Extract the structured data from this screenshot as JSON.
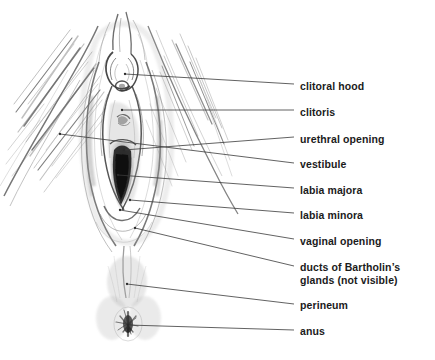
{
  "figure": {
    "background_color": "#ffffff",
    "ink_color": "#1b1b1b",
    "leader_line_color": "#3a3a3a",
    "illustration_style": "graphite pencil sketch with hatching"
  },
  "labels": [
    {
      "id": "clitoral-hood",
      "text": "clitoral hood",
      "text_x": 300,
      "text_y": 87,
      "leader": {
        "x1": 125,
        "y1": 74,
        "x2": 294,
        "y2": 84
      }
    },
    {
      "id": "clitoris",
      "text": "clitoris",
      "text_x": 300,
      "text_y": 113,
      "leader": {
        "x1": 122,
        "y1": 110,
        "x2": 294,
        "y2": 110
      }
    },
    {
      "id": "urethral-opening",
      "text": "urethral opening",
      "text_x": 300,
      "text_y": 140,
      "leader": {
        "x1": 124,
        "y1": 150,
        "x2": 294,
        "y2": 137
      }
    },
    {
      "id": "vestibule",
      "text": "vestibule",
      "text_x": 300,
      "text_y": 165,
      "leader": {
        "x1": 60,
        "y1": 134,
        "x2": 294,
        "y2": 163
      }
    },
    {
      "id": "labia-majora",
      "text": "labia majora",
      "text_x": 300,
      "text_y": 191,
      "leader": {
        "x1": 118,
        "y1": 175,
        "x2": 294,
        "y2": 188
      }
    },
    {
      "id": "labia-minora",
      "text": "labia minora",
      "text_x": 300,
      "text_y": 216,
      "leader": {
        "x1": 130,
        "y1": 200,
        "x2": 294,
        "y2": 213
      }
    },
    {
      "id": "vaginal-opening",
      "text": "vaginal opening",
      "text_x": 300,
      "text_y": 242,
      "leader": {
        "x1": 120,
        "y1": 210,
        "x2": 294,
        "y2": 239
      }
    },
    {
      "id": "ducts-of-bartholins-glands",
      "text": "ducts of Bartholin’s glands (not visible)",
      "text_x": 300,
      "text_y": 268,
      "two_line": true,
      "leader": {
        "x1": 135,
        "y1": 228,
        "x2": 294,
        "y2": 266
      }
    },
    {
      "id": "perineum",
      "text": "perineum",
      "text_x": 300,
      "text_y": 306,
      "leader": {
        "x1": 127,
        "y1": 284,
        "x2": 294,
        "y2": 304
      }
    },
    {
      "id": "anus",
      "text": "anus",
      "text_x": 300,
      "text_y": 332,
      "leader": {
        "x1": 128,
        "y1": 325,
        "x2": 294,
        "y2": 330
      }
    }
  ]
}
